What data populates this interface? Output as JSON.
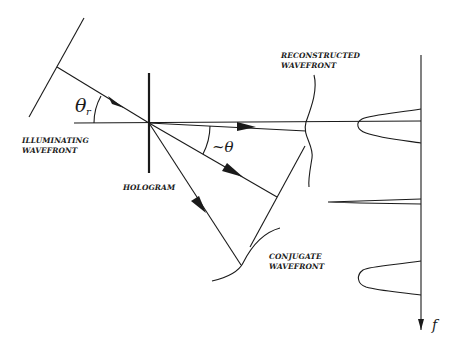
{
  "labels": {
    "illuminating": [
      "ILLUMINATING",
      "WAVEFRONT"
    ],
    "hologram": "HOLOGRAM",
    "reconstructed": [
      "RECONSTRUCTED",
      "WAVEFRONT"
    ],
    "conjugate": [
      "CONJUGATE",
      "WAVEFRONT"
    ]
  },
  "symbols": {
    "theta_r": "θ",
    "theta_r_sub": "r",
    "theta_approx": "~θ",
    "freq_axis": "f"
  },
  "colors": {
    "ink": "#1a1a1a",
    "background": "#ffffff"
  }
}
